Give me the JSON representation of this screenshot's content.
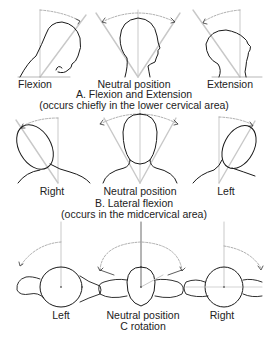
{
  "sections": [
    {
      "id": "A",
      "title": "A. Flexion and Extension",
      "subtitle": "(occurs chiefly in the lower cervical area)",
      "views": [
        {
          "label": "Flexion"
        },
        {
          "label": "Neutral position"
        },
        {
          "label": "Extension"
        }
      ]
    },
    {
      "id": "B",
      "title": "B. Lateral flexion",
      "subtitle": "(occurs in the midcervical area)",
      "views": [
        {
          "label": "Right"
        },
        {
          "label": "Neutral position"
        },
        {
          "label": "Left"
        }
      ]
    },
    {
      "id": "C",
      "title": "C rotation",
      "views": [
        {
          "label": "Left"
        },
        {
          "label": "Neutral position"
        },
        {
          "label": "Right"
        }
      ]
    }
  ],
  "colors": {
    "outline": "#1a1a1a",
    "guide": "#bdbdbd",
    "arc": "#8a8a8a"
  }
}
